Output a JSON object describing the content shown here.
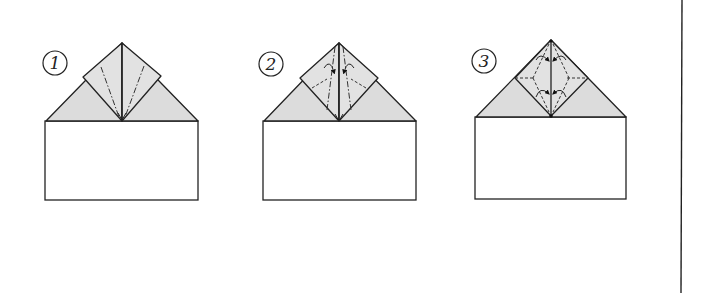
{
  "diagram": {
    "type": "origami-instructions",
    "colors": {
      "line": "#222222",
      "shaded_paper": "#dcdcdc",
      "flap": "#e2e2e2",
      "background": "#ffffff"
    },
    "steps": [
      {
        "number": "1",
        "description": "Paper with top corners folded to center; inner flaps marked with mountain-fold lines"
      },
      {
        "number": "2",
        "description": "Flaps with mountain and valley fold lines and folding arrows"
      },
      {
        "number": "3",
        "description": "Diamond with valley-fold lines and rotation arrows"
      }
    ],
    "legend": {
      "mountain_fold": "dash-dot line",
      "valley_fold": "dashed line"
    }
  }
}
